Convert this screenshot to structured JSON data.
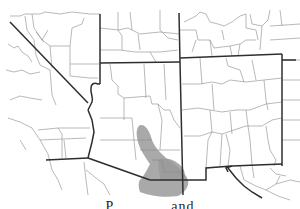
{
  "map": {
    "region": "Southwestern United States",
    "states_visible": [
      "California",
      "Nevada",
      "Utah",
      "Colorado",
      "Arizona",
      "New Mexico",
      "Texas"
    ],
    "shaded_range": {
      "label": "species distribution",
      "color": "#9a9a9a",
      "location": "southeastern Arizona and southwestern New Mexico"
    },
    "colors": {
      "county_lines": "#8a8a8a",
      "state_lines": "#2e2e2e",
      "background": "#ffffff"
    }
  },
  "caption": {
    "text": "P... ...... ..and",
    "visible_note": "caption text cut off at bottom edge"
  }
}
